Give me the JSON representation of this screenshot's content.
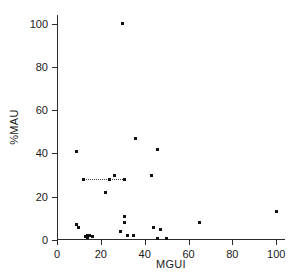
{
  "chart_data": {
    "type": "scatter",
    "title": "",
    "xlabel": "MGUI",
    "ylabel": "%MAU",
    "xlim": [
      0,
      104
    ],
    "ylim": [
      0,
      104
    ],
    "xticks": [
      0,
      20,
      40,
      60,
      80,
      100
    ],
    "yticks": [
      0,
      20,
      40,
      60,
      80,
      100
    ],
    "xtick_labels": [
      "0",
      "20",
      "40",
      "60",
      "80",
      "100"
    ],
    "ytick_labels": [
      "0",
      "20",
      "40",
      "60",
      "80",
      "100"
    ],
    "grid": false,
    "legend": null,
    "marker": "square",
    "marker_color": "#111111",
    "axis_color": "#2b2b2b",
    "points": [
      {
        "x": 9,
        "y": 41
      },
      {
        "x": 9,
        "y": 7
      },
      {
        "x": 10,
        "y": 6
      },
      {
        "x": 12,
        "y": 28
      },
      {
        "x": 13,
        "y": 1.5
      },
      {
        "x": 14,
        "y": 2
      },
      {
        "x": 14,
        "y": 1
      },
      {
        "x": 15,
        "y": 2
      },
      {
        "x": 16,
        "y": 1.5
      },
      {
        "x": 22,
        "y": 22
      },
      {
        "x": 24,
        "y": 28
      },
      {
        "x": 26,
        "y": 30
      },
      {
        "x": 29,
        "y": 4
      },
      {
        "x": 30,
        "y": 100
      },
      {
        "x": 31,
        "y": 11
      },
      {
        "x": 31,
        "y": 8
      },
      {
        "x": 31,
        "y": 28
      },
      {
        "x": 32,
        "y": 2
      },
      {
        "x": 35,
        "y": 2
      },
      {
        "x": 36,
        "y": 47
      },
      {
        "x": 43,
        "y": 30
      },
      {
        "x": 44,
        "y": 6
      },
      {
        "x": 46,
        "y": 42
      },
      {
        "x": 46,
        "y": 0.5
      },
      {
        "x": 47,
        "y": 5
      },
      {
        "x": 50,
        "y": 0.5
      },
      {
        "x": 65,
        "y": 8
      },
      {
        "x": 100,
        "y": 13
      }
    ],
    "reference_line": {
      "style": "dotted",
      "y": 28,
      "x_start": 12,
      "x_end": 31,
      "color": "#3a3a3a"
    }
  }
}
